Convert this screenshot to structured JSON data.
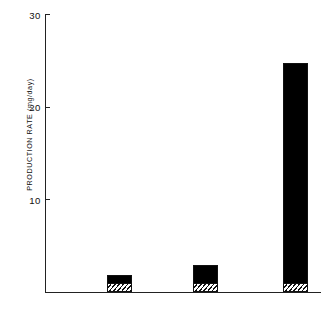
{
  "chart_data": {
    "type": "bar",
    "title": "",
    "xlabel": "",
    "ylabel": "PRODUCTION RATE (mg/day)",
    "categories": [
      "MENSES",
      "PREOVUL",
      "MIDLUTEAL"
    ],
    "values": [
      1.8,
      2.9,
      24.8
    ],
    "series": [
      {
        "name": "hatched-segment",
        "values": [
          0.9,
          0.9,
          0.9
        ]
      },
      {
        "name": "solid-segment",
        "values": [
          0.9,
          2.0,
          23.9
        ]
      }
    ],
    "ylim": [
      0,
      30
    ],
    "yticks": [
      10,
      20,
      30
    ],
    "ytick_labels": [
      "10",
      "20",
      "30"
    ],
    "grid": false,
    "legend": "none",
    "bar_fill_color": "#000000",
    "axis_color": "#222222",
    "background_color": "#ffffff"
  },
  "axis": {
    "y_label": "PRODUCTION RATE (mg/day)",
    "ticks": [
      {
        "label": "30",
        "value": 30
      },
      {
        "label": "20",
        "value": 20
      },
      {
        "label": "10",
        "value": 10
      }
    ]
  },
  "bars": [
    {
      "label": "MENSES",
      "total": 1.8,
      "hatched": 0.9
    },
    {
      "label": "PREOVUL",
      "total": 2.9,
      "hatched": 0.9
    },
    {
      "label": "MIDLUTEAL",
      "total": 24.8,
      "hatched": 0.9
    }
  ]
}
